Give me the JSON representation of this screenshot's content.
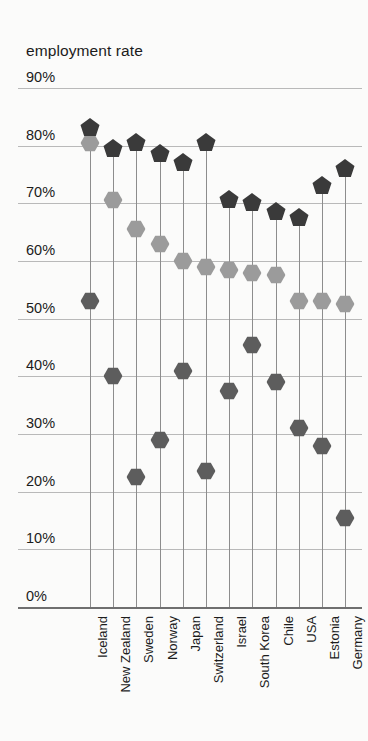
{
  "chart_data": {
    "type": "scatter",
    "title": "employment rate",
    "xlabel": "",
    "ylabel": "",
    "ylim": [
      0,
      90
    ],
    "ytick_labels": [
      "0%",
      "10%",
      "20%",
      "30%",
      "40%",
      "50%",
      "60%",
      "70%",
      "80%",
      "90%"
    ],
    "ytick_values": [
      0,
      10,
      20,
      30,
      40,
      50,
      60,
      70,
      80,
      90
    ],
    "grid": true,
    "legend_position": "none",
    "categories": [
      "Iceland",
      "New Zealand",
      "Sweden",
      "Norway",
      "Japan",
      "Switzerland",
      "Israel",
      "South Korea",
      "Chile",
      "USA",
      "Estonia",
      "Germany"
    ],
    "series": [
      {
        "name": "series-1",
        "marker": "pentagon",
        "color": "#3a3a3a",
        "values": [
          83.0,
          79.5,
          80.5,
          78.5,
          77.0,
          80.5,
          70.5,
          70.0,
          68.5,
          67.5,
          73.0,
          76.0
        ]
      },
      {
        "name": "series-2",
        "marker": "hexagon",
        "color": "#9b9b9b",
        "values": [
          80.5,
          70.5,
          65.5,
          63.0,
          60.0,
          59.0,
          58.5,
          58.0,
          57.5,
          53.0,
          53.0,
          52.5
        ]
      },
      {
        "name": "series-3",
        "marker": "hexagon",
        "color": "#5d5d5d",
        "values": [
          53.0,
          40.0,
          22.5,
          29.0,
          41.0,
          23.5,
          37.5,
          45.5,
          39.0,
          31.0,
          28.0,
          15.5
        ]
      }
    ]
  },
  "colors": {
    "background": "#fbfbfa",
    "text": "#1c1c1c",
    "gridline": "#b9b9b9",
    "column_line": "#8d8d8d",
    "axis": "#6f6f6f"
  }
}
